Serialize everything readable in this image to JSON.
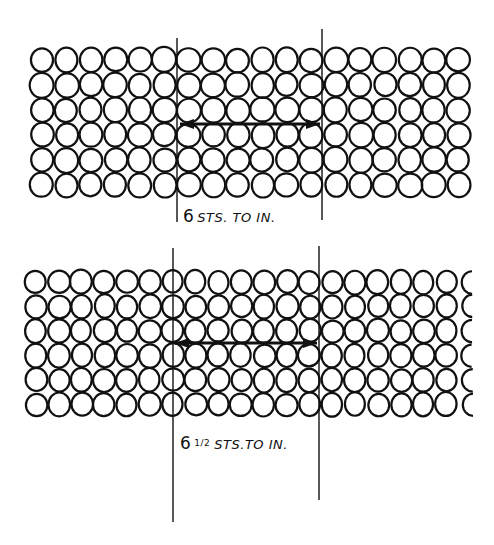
{
  "colors": {
    "ink": "#111111",
    "paper": "#ffffff"
  },
  "diagrams": [
    {
      "id": "gauge-6",
      "label": {
        "number": "6",
        "fraction": "",
        "text": "STS. TO IN."
      },
      "grid": {
        "cols": 18,
        "rows": 6,
        "x0": 42,
        "y0": 60,
        "dx": 24.5,
        "dy": 25,
        "rx": 11.5,
        "ry": 12,
        "partial_last_col": false
      },
      "left_line": {
        "x": 177,
        "y1": 38,
        "y2": 222
      },
      "right_line": {
        "x": 322,
        "y1": 29,
        "y2": 220
      },
      "arrow": {
        "y": 124,
        "x1": 180,
        "x2": 320
      },
      "label_pos": {
        "x": 183,
        "y": 206
      }
    },
    {
      "id": "gauge-6-5",
      "label": {
        "number": "6",
        "fraction": "1/2",
        "text": "STS.TO IN."
      },
      "grid": {
        "cols": 20,
        "rows": 6,
        "x0": 36,
        "y0": 282,
        "dx": 22.8,
        "dy": 24.5,
        "rx": 10.5,
        "ry": 11.5,
        "partial_last_col": true
      },
      "left_line": {
        "x": 173,
        "y1": 248,
        "y2": 522
      },
      "right_line": {
        "x": 319,
        "y1": 246,
        "y2": 500
      },
      "arrow": {
        "y": 343,
        "x1": 175,
        "x2": 317
      },
      "label_pos": {
        "x": 180,
        "y": 433
      }
    }
  ]
}
